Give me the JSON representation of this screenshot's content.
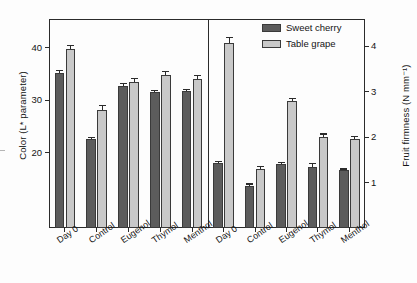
{
  "chart_data": {
    "type": "bar",
    "title": "",
    "panels": [
      {
        "name": "left-panel",
        "ylabel": "Color (L* parameter)",
        "axis": "left",
        "ylim": [
          5.6,
          45.5
        ],
        "yticks": [
          20,
          30,
          40
        ],
        "categories": [
          "Day 0",
          "Control",
          "Eugenol",
          "Thymol",
          "Menthol"
        ],
        "series": [
          {
            "name": "Sweet cherry",
            "color": "#5c5c5c",
            "values": [
              35.1,
              22.5,
              32.8,
              31.6,
              31.7
            ],
            "errors": [
              0.6,
              0.4,
              0.5,
              0.4,
              0.5
            ]
          },
          {
            "name": "Table grape",
            "color": "#c9c9c9",
            "values": [
              39.7,
              28.2,
              33.5,
              34.8,
              34.0
            ],
            "errors": [
              0.9,
              0.9,
              0.8,
              0.8,
              0.8
            ]
          }
        ]
      },
      {
        "name": "right-panel",
        "ylabel": "Fruit firmness (N mm⁻¹)",
        "axis": "right",
        "ylim": [
          0.0,
          4.6
        ],
        "yticks": [
          1,
          2,
          3,
          4
        ],
        "categories": [
          "Day 0",
          "Control",
          "Eugenol",
          "Thymol",
          "Menthol"
        ],
        "series": [
          {
            "name": "Sweet cherry",
            "color": "#5c5c5c",
            "values": [
              1.43,
              0.93,
              1.41,
              1.35,
              1.27
            ],
            "errors": [
              0.04,
              0.05,
              0.04,
              0.08,
              0.04
            ]
          },
          {
            "name": "Table grape",
            "color": "#c9c9c9",
            "values": [
              4.08,
              1.29,
              2.79,
              2.01,
              1.96
            ],
            "errors": [
              0.12,
              0.07,
              0.07,
              0.07,
              0.06
            ]
          }
        ]
      }
    ],
    "legend": {
      "position": "top-right",
      "entries": [
        {
          "label": "Sweet cherry",
          "color": "#5c5c5c"
        },
        {
          "label": "Table grape",
          "color": "#c9c9c9"
        }
      ]
    },
    "grid": false,
    "xlabel": ""
  },
  "axes": {
    "left": {
      "label": "Color (L* parameter)",
      "ticks": [
        "20",
        "30",
        "40"
      ]
    },
    "right": {
      "label": "Fruit firmness (N mm⁻¹)",
      "ticks": [
        "1",
        "2",
        "3",
        "4"
      ]
    }
  },
  "legend": {
    "cherry_label": "Sweet cherry",
    "grape_label": "Table grape"
  },
  "categories": {
    "left": [
      "Day 0",
      "Control",
      "Eugenol",
      "Thymol",
      "Menthol"
    ],
    "right": [
      "Day 0",
      "Control",
      "Eugenol",
      "Thymol",
      "Menthol"
    ]
  }
}
